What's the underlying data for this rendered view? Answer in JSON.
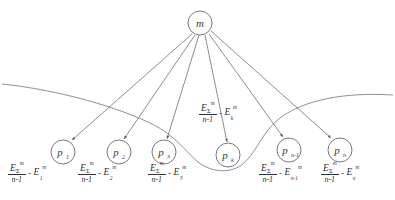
{
  "diagram": {
    "type": "star-graph",
    "title": "",
    "background_color": "#ffffff",
    "line_color": "#5a5a66",
    "text_color": "#2f2f36"
  },
  "root_node": {
    "id": "m",
    "label": "m",
    "cx": 200,
    "cy": 23,
    "r": 12
  },
  "leaf_nodes": [
    {
      "id": "p1",
      "base": "p",
      "subscript": "1",
      "cx": 63,
      "cy": 152,
      "r": 12
    },
    {
      "id": "p2",
      "base": "p",
      "subscript": "2",
      "cx": 119,
      "cy": 152,
      "r": 12
    },
    {
      "id": "p3",
      "base": "p",
      "subscript": "3",
      "cx": 164,
      "cy": 152,
      "r": 12
    },
    {
      "id": "pk",
      "base": "p",
      "subscript": "k",
      "cx": 228,
      "cy": 155,
      "r": 12
    },
    {
      "id": "pn1",
      "base": "p",
      "subscript": "n-1",
      "cx": 289,
      "cy": 150,
      "r": 12
    },
    {
      "id": "pn",
      "base": "p",
      "subscript": "n",
      "cx": 340,
      "cy": 150,
      "r": 12
    }
  ],
  "formulas": [
    {
      "id": "formula-p1",
      "target_node": "p1",
      "numerator": "E",
      "numerator_sub": "Σ",
      "numerator_sup": "m",
      "denominator": "n-1",
      "operator": "-",
      "term": "E",
      "term_sub": "1",
      "term_sup": "m",
      "x": 8,
      "y": 163
    },
    {
      "id": "formula-p2",
      "target_node": "p2",
      "numerator": "E",
      "numerator_sub": "Σ",
      "numerator_sup": "m",
      "denominator": "n-1",
      "operator": "-",
      "term": "E",
      "term_sub": "2",
      "term_sup": "m",
      "x": 78,
      "y": 163
    },
    {
      "id": "formula-p3",
      "target_node": "p3",
      "numerator": "E",
      "numerator_sub": "Σ",
      "numerator_sup": "m",
      "denominator": "n-1",
      "operator": "-",
      "term": "E",
      "term_sub": "3",
      "term_sup": "m",
      "x": 148,
      "y": 163
    },
    {
      "id": "formula-pk",
      "target_node": "pk",
      "numerator": "E",
      "numerator_sub": "Σ",
      "numerator_sup": "m",
      "denominator": "n-1",
      "operator": "-",
      "term": "E",
      "term_sub": "k",
      "term_sup": "m",
      "x": 199,
      "y": 105
    },
    {
      "id": "formula-pn1",
      "target_node": "pn1",
      "numerator": "E",
      "numerator_sub": "Σ",
      "numerator_sup": "m",
      "denominator": "n-1",
      "operator": "-",
      "term": "E",
      "term_sub": "n-1",
      "term_sup": "m",
      "x": 263,
      "y": 163
    },
    {
      "id": "formula-pn",
      "target_node": "pn",
      "numerator": "E",
      "numerator_sub": "Σ",
      "numerator_sup": "m",
      "denominator": "n-1",
      "operator": "-",
      "term": "E",
      "term_sub": "n",
      "term_sup": "m",
      "x": 321,
      "y": 163
    }
  ],
  "edges": [
    {
      "id": "edge-m-p1",
      "from": "m",
      "to": "p1",
      "arrow": true
    },
    {
      "id": "edge-m-p2",
      "from": "m",
      "to": "p2",
      "arrow": true
    },
    {
      "id": "edge-m-p3",
      "from": "m",
      "to": "p3",
      "arrow": true
    },
    {
      "id": "edge-m-pk",
      "from": "m",
      "to": "pk",
      "arrow": true
    },
    {
      "id": "edge-m-pn1",
      "from": "m",
      "to": "pn1",
      "arrow": true
    },
    {
      "id": "edge-m-pn",
      "from": "m",
      "to": "pn",
      "arrow": true
    }
  ],
  "boundary_curve": {
    "id": "cluster-boundary",
    "description": "Open free-form curve sweeping from left edge across the diagram, dipping below node p-k and rising to the right edge."
  }
}
